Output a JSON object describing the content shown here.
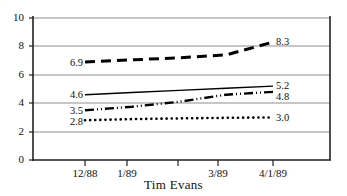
{
  "chart_data": {
    "type": "line",
    "title": "Tim Evans",
    "xlabel": "",
    "ylabel": "",
    "ylim": [
      0,
      10
    ],
    "yticks": [
      0,
      2,
      4,
      6,
      8,
      10
    ],
    "ytick_labels": [
      "0",
      "2",
      "4",
      "6",
      "8",
      "10"
    ],
    "grid": true,
    "grid_color": "#9a9a9a",
    "axis_color": "#222222",
    "legend": "none",
    "x": [
      0,
      1,
      2,
      3,
      4
    ],
    "xtick_labels": [
      "12/88",
      "1/89",
      "",
      "3/89",
      "4/1/89"
    ],
    "categories": [
      "12/88",
      "1/89",
      "",
      "3/89",
      "4/1/89"
    ],
    "series": [
      {
        "name": "series-dashed",
        "style": "dashed",
        "color": "#000000",
        "width": 3.0,
        "values": [
          6.9,
          7.05,
          7.2,
          7.4,
          8.3
        ],
        "start_label": "6.9",
        "end_label": "8.3"
      },
      {
        "name": "series-solid",
        "style": "solid",
        "color": "#000000",
        "width": 1.4,
        "values": [
          4.6,
          4.75,
          4.9,
          5.05,
          5.2
        ],
        "start_label": "4.6",
        "end_label": "5.2"
      },
      {
        "name": "series-dash-dot-dot",
        "style": "dash-dot-dot",
        "color": "#000000",
        "width": 2.4,
        "values": [
          3.5,
          3.75,
          4.1,
          4.6,
          4.8
        ],
        "start_label": "3.5",
        "end_label": "4.8"
      },
      {
        "name": "series-dotted",
        "style": "dotted",
        "color": "#000000",
        "width": 2.6,
        "values": [
          2.8,
          2.88,
          2.93,
          2.97,
          3.0
        ],
        "start_label": "2.8",
        "end_label": "3.0"
      }
    ]
  },
  "axis": {
    "y_labels": [
      "10",
      "8",
      "6",
      "4",
      "2",
      "0"
    ],
    "x_labels": [
      "12/88",
      "1/89",
      "3/89",
      "4/1/89"
    ]
  },
  "labels": {
    "left": [
      "6.9",
      "4.6",
      "3.5",
      "2.8"
    ],
    "right": [
      "8.3",
      "5.2",
      "4.8",
      "3.0"
    ]
  },
  "title": "Tim Evans"
}
